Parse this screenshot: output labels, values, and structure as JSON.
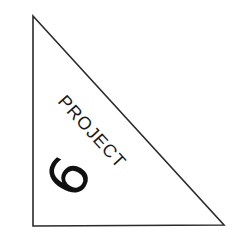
{
  "logo": {
    "word": "PROJECT",
    "number": "6",
    "shape": "right-triangle",
    "stroke_color": "#2a2a2a",
    "text_color": "#1a1a1a",
    "background": "#ffffff"
  }
}
